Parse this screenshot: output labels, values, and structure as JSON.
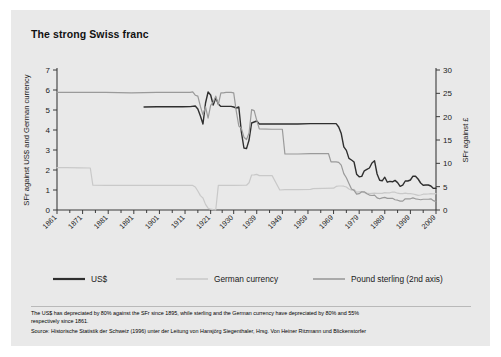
{
  "card": {
    "title": "The strong Swiss franc",
    "background_color": "#e9e9e9"
  },
  "footnote": {
    "line1": "The US$ has depreciated by 80% against the SFr since 1895, while sterling and the German currency have depreciated by 80% and 55%",
    "line2": "respectively since 1861.",
    "line3": "Source: Historische Statistik der Schweiz (1996) unter der Leitung von Hansjörg Siegenthaler, Hrsg. Von Heiner Ritzmann und Blickenstorfer"
  },
  "legend": {
    "items": [
      {
        "label": "US$",
        "color": "#2f2f2f"
      },
      {
        "label": "German currency",
        "color": "#c9c9c9"
      },
      {
        "label": "Pound sterling (2nd axis)",
        "color": "#9a9a9a"
      }
    ]
  },
  "chart_data": {
    "type": "line",
    "title": "The strong Swiss franc",
    "xlabel": "",
    "ylabel": "SFr against US$ and German currency",
    "y2label": "SFr against £",
    "ylim": [
      0,
      7
    ],
    "y2lim": [
      0,
      30
    ],
    "yticks": [
      0,
      1,
      2,
      3,
      4,
      5,
      6,
      7
    ],
    "y2ticks": [
      0,
      5,
      10,
      15,
      20,
      25,
      30
    ],
    "xlim": [
      1861,
      2009
    ],
    "xticks": [
      1861,
      1871,
      1881,
      1891,
      1901,
      1911,
      1921,
      1930,
      1939,
      1949,
      1959,
      1969,
      1979,
      1989,
      1999,
      2009
    ],
    "grid": false,
    "legend_position": "bottom",
    "series": [
      {
        "name": "US$",
        "axis": "left",
        "color": "#2f2f2f",
        "points": [
          [
            1895,
            5.15
          ],
          [
            1900,
            5.16
          ],
          [
            1905,
            5.16
          ],
          [
            1910,
            5.16
          ],
          [
            1913,
            5.17
          ],
          [
            1915,
            5.2
          ],
          [
            1916,
            5.05
          ],
          [
            1917,
            4.7
          ],
          [
            1918,
            4.3
          ],
          [
            1919,
            5.35
          ],
          [
            1920,
            5.9
          ],
          [
            1921,
            5.75
          ],
          [
            1922,
            5.25
          ],
          [
            1923,
            5.6
          ],
          [
            1924,
            5.3
          ],
          [
            1925,
            5.18
          ],
          [
            1926,
            5.18
          ],
          [
            1927,
            5.18
          ],
          [
            1928,
            5.18
          ],
          [
            1929,
            5.18
          ],
          [
            1930,
            5.15
          ],
          [
            1931,
            5.1
          ],
          [
            1932,
            5.15
          ],
          [
            1933,
            3.9
          ],
          [
            1934,
            3.1
          ],
          [
            1935,
            3.07
          ],
          [
            1936,
            3.5
          ],
          [
            1937,
            4.35
          ],
          [
            1938,
            4.4
          ],
          [
            1939,
            4.45
          ],
          [
            1940,
            4.3
          ],
          [
            1941,
            4.3
          ],
          [
            1942,
            4.3
          ],
          [
            1943,
            4.3
          ],
          [
            1944,
            4.3
          ],
          [
            1945,
            4.3
          ],
          [
            1946,
            4.3
          ],
          [
            1949,
            4.3
          ],
          [
            1955,
            4.3
          ],
          [
            1960,
            4.32
          ],
          [
            1965,
            4.32
          ],
          [
            1968,
            4.32
          ],
          [
            1970,
            4.32
          ],
          [
            1971,
            4.15
          ],
          [
            1972,
            3.82
          ],
          [
            1973,
            3.16
          ],
          [
            1974,
            2.98
          ],
          [
            1975,
            2.58
          ],
          [
            1976,
            2.5
          ],
          [
            1977,
            2.4
          ],
          [
            1978,
            1.79
          ],
          [
            1979,
            1.66
          ],
          [
            1980,
            1.68
          ],
          [
            1981,
            1.96
          ],
          [
            1982,
            2.03
          ],
          [
            1983,
            2.1
          ],
          [
            1984,
            2.35
          ],
          [
            1985,
            2.46
          ],
          [
            1986,
            1.8
          ],
          [
            1987,
            1.49
          ],
          [
            1988,
            1.46
          ],
          [
            1989,
            1.64
          ],
          [
            1990,
            1.39
          ],
          [
            1991,
            1.43
          ],
          [
            1992,
            1.41
          ],
          [
            1993,
            1.48
          ],
          [
            1994,
            1.37
          ],
          [
            1995,
            1.18
          ],
          [
            1996,
            1.24
          ],
          [
            1997,
            1.45
          ],
          [
            1998,
            1.45
          ],
          [
            1999,
            1.5
          ],
          [
            2000,
            1.69
          ],
          [
            2001,
            1.69
          ],
          [
            2002,
            1.55
          ],
          [
            2003,
            1.35
          ],
          [
            2004,
            1.24
          ],
          [
            2005,
            1.25
          ],
          [
            2006,
            1.25
          ],
          [
            2007,
            1.2
          ],
          [
            2008,
            1.08
          ],
          [
            2009,
            1.09
          ]
        ]
      },
      {
        "name": "German currency",
        "axis": "left",
        "color": "#c9c9c9",
        "points": [
          [
            1861,
            2.12
          ],
          [
            1865,
            2.12
          ],
          [
            1870,
            2.11
          ],
          [
            1874,
            2.1
          ],
          [
            1875,
            1.24
          ],
          [
            1880,
            1.23
          ],
          [
            1890,
            1.23
          ],
          [
            1900,
            1.23
          ],
          [
            1910,
            1.23
          ],
          [
            1914,
            1.23
          ],
          [
            1915,
            1.15
          ],
          [
            1916,
            0.95
          ],
          [
            1917,
            0.72
          ],
          [
            1918,
            0.6
          ],
          [
            1919,
            0.28
          ],
          [
            1920,
            0.09
          ],
          [
            1921,
            0.04
          ],
          [
            1922,
            0.02
          ],
          [
            1923,
            0.01
          ],
          [
            1924,
            1.23
          ],
          [
            1925,
            1.23
          ],
          [
            1926,
            1.23
          ],
          [
            1930,
            1.23
          ],
          [
            1935,
            1.24
          ],
          [
            1936,
            1.36
          ],
          [
            1937,
            1.75
          ],
          [
            1938,
            1.76
          ],
          [
            1939,
            1.78
          ],
          [
            1940,
            1.72
          ],
          [
            1945,
            1.72
          ],
          [
            1948,
            1.0
          ],
          [
            1950,
            1.02
          ],
          [
            1955,
            1.02
          ],
          [
            1960,
            1.03
          ],
          [
            1961,
            1.07
          ],
          [
            1965,
            1.08
          ],
          [
            1969,
            1.09
          ],
          [
            1970,
            1.18
          ],
          [
            1971,
            1.2
          ],
          [
            1972,
            1.2
          ],
          [
            1973,
            1.19
          ],
          [
            1974,
            1.15
          ],
          [
            1975,
            1.05
          ],
          [
            1976,
            0.99
          ],
          [
            1977,
            1.03
          ],
          [
            1978,
            0.89
          ],
          [
            1979,
            0.91
          ],
          [
            1980,
            0.92
          ],
          [
            1981,
            0.87
          ],
          [
            1982,
            0.84
          ],
          [
            1983,
            0.82
          ],
          [
            1984,
            0.83
          ],
          [
            1985,
            0.84
          ],
          [
            1986,
            0.83
          ],
          [
            1987,
            0.83
          ],
          [
            1988,
            0.83
          ],
          [
            1989,
            0.87
          ],
          [
            1990,
            0.86
          ],
          [
            1991,
            0.86
          ],
          [
            1992,
            0.9
          ],
          [
            1993,
            0.89
          ],
          [
            1994,
            0.84
          ],
          [
            1995,
            0.82
          ],
          [
            1996,
            0.82
          ],
          [
            1997,
            0.84
          ],
          [
            1998,
            0.82
          ],
          [
            1999,
            0.82
          ],
          [
            2000,
            0.8
          ],
          [
            2001,
            0.77
          ],
          [
            2002,
            0.73
          ],
          [
            2003,
            0.75
          ],
          [
            2004,
            0.79
          ],
          [
            2005,
            0.79
          ],
          [
            2006,
            0.8
          ],
          [
            2007,
            0.82
          ],
          [
            2008,
            0.81
          ],
          [
            2009,
            0.82
          ]
        ]
      },
      {
        "name": "Pound sterling (2nd axis)",
        "axis": "right",
        "color": "#9a9a9a",
        "points": [
          [
            1861,
            25.2
          ],
          [
            1870,
            25.2
          ],
          [
            1880,
            25.2
          ],
          [
            1890,
            25.1
          ],
          [
            1900,
            25.2
          ],
          [
            1910,
            25.2
          ],
          [
            1913,
            25.2
          ],
          [
            1914,
            25.3
          ],
          [
            1915,
            24.6
          ],
          [
            1916,
            24.4
          ],
          [
            1917,
            22.2
          ],
          [
            1918,
            20.4
          ],
          [
            1919,
            22.1
          ],
          [
            1920,
            19.7
          ],
          [
            1921,
            22.4
          ],
          [
            1922,
            23.1
          ],
          [
            1923,
            24.4
          ],
          [
            1924,
            22.6
          ],
          [
            1925,
            25.1
          ],
          [
            1926,
            25.1
          ],
          [
            1927,
            25.2
          ],
          [
            1928,
            25.2
          ],
          [
            1929,
            25.2
          ],
          [
            1930,
            25.1
          ],
          [
            1931,
            21.2
          ],
          [
            1932,
            18.0
          ],
          [
            1933,
            17.5
          ],
          [
            1934,
            15.6
          ],
          [
            1935,
            15.1
          ],
          [
            1936,
            16.5
          ],
          [
            1937,
            21.5
          ],
          [
            1938,
            21.3
          ],
          [
            1939,
            19.2
          ],
          [
            1940,
            17.4
          ],
          [
            1945,
            17.3
          ],
          [
            1949,
            17.3
          ],
          [
            1950,
            12.0
          ],
          [
            1955,
            12.0
          ],
          [
            1960,
            12.1
          ],
          [
            1965,
            12.1
          ],
          [
            1967,
            12.1
          ],
          [
            1968,
            10.3
          ],
          [
            1970,
            10.3
          ],
          [
            1971,
            10.2
          ],
          [
            1972,
            9.6
          ],
          [
            1973,
            7.8
          ],
          [
            1974,
            6.9
          ],
          [
            1975,
            5.7
          ],
          [
            1976,
            4.5
          ],
          [
            1977,
            4.2
          ],
          [
            1978,
            3.4
          ],
          [
            1979,
            3.5
          ],
          [
            1980,
            3.9
          ],
          [
            1981,
            3.9
          ],
          [
            1982,
            3.5
          ],
          [
            1983,
            3.2
          ],
          [
            1984,
            3.1
          ],
          [
            1985,
            3.2
          ],
          [
            1986,
            2.6
          ],
          [
            1987,
            2.4
          ],
          [
            1988,
            2.6
          ],
          [
            1989,
            2.7
          ],
          [
            1990,
            2.5
          ],
          [
            1991,
            2.5
          ],
          [
            1992,
            2.5
          ],
          [
            1993,
            2.2
          ],
          [
            1994,
            2.1
          ],
          [
            1995,
            1.9
          ],
          [
            1996,
            1.9
          ],
          [
            1997,
            2.4
          ],
          [
            1998,
            2.4
          ],
          [
            1999,
            2.4
          ],
          [
            2000,
            2.6
          ],
          [
            2001,
            2.4
          ],
          [
            2002,
            2.3
          ],
          [
            2003,
            2.2
          ],
          [
            2004,
            2.3
          ],
          [
            2005,
            2.3
          ],
          [
            2006,
            2.3
          ],
          [
            2007,
            2.4
          ],
          [
            2008,
            2.0
          ],
          [
            2009,
            1.8
          ]
        ]
      }
    ]
  }
}
